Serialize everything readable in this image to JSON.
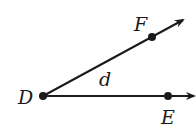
{
  "diagram": {
    "type": "angle",
    "vertex": {
      "label": "D"
    },
    "rays": [
      {
        "through": "F",
        "label": "F"
      },
      {
        "through": "E",
        "label": "E"
      }
    ],
    "angle_label": "d",
    "colors": {
      "stroke": "#1a1a1a",
      "background": "#ffffff"
    }
  }
}
